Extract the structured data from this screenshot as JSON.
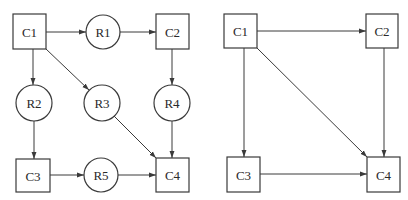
{
  "diagrams": [
    {
      "name": "left-graph",
      "nodes": [
        {
          "id": "C1",
          "label": "C1",
          "shape": "box",
          "x": 13,
          "y": 14,
          "w": 33,
          "h": 35
        },
        {
          "id": "R1",
          "label": "R1",
          "shape": "circle",
          "cx": 103,
          "cy": 32,
          "r": 17
        },
        {
          "id": "C2",
          "label": "C2",
          "shape": "box",
          "x": 156,
          "y": 14,
          "w": 33,
          "h": 35
        },
        {
          "id": "R2",
          "label": "R2",
          "shape": "circle",
          "cx": 34,
          "cy": 103,
          "r": 18
        },
        {
          "id": "R3",
          "label": "R3",
          "shape": "circle",
          "cx": 102,
          "cy": 103,
          "r": 18
        },
        {
          "id": "R4",
          "label": "R4",
          "shape": "circle",
          "cx": 172,
          "cy": 103,
          "r": 18
        },
        {
          "id": "C3",
          "label": "C3",
          "shape": "box",
          "x": 16,
          "y": 159,
          "w": 34,
          "h": 33
        },
        {
          "id": "R5",
          "label": "R5",
          "shape": "circle",
          "cx": 101,
          "cy": 175,
          "r": 17
        },
        {
          "id": "C4",
          "label": "C4",
          "shape": "box",
          "x": 156,
          "y": 158,
          "w": 33,
          "h": 34
        }
      ],
      "edges": [
        {
          "from": "C1",
          "to": "R1",
          "x1": 46,
          "y1": 32,
          "x2": 86,
          "y2": 32
        },
        {
          "from": "R1",
          "to": "C2",
          "x1": 120,
          "y1": 32,
          "x2": 156,
          "y2": 32
        },
        {
          "from": "C1",
          "to": "R2",
          "x1": 33,
          "y1": 49,
          "x2": 33,
          "y2": 85
        },
        {
          "from": "C1",
          "to": "R3",
          "x1": 46,
          "y1": 49,
          "x2": 89,
          "y2": 90
        },
        {
          "from": "C2",
          "to": "R4",
          "x1": 172,
          "y1": 49,
          "x2": 172,
          "y2": 85
        },
        {
          "from": "R2",
          "to": "C3",
          "x1": 34,
          "y1": 121,
          "x2": 34,
          "y2": 159
        },
        {
          "from": "R3",
          "to": "C4",
          "x1": 114,
          "y1": 116,
          "x2": 156,
          "y2": 158
        },
        {
          "from": "R4",
          "to": "C4",
          "x1": 172,
          "y1": 121,
          "x2": 172,
          "y2": 158
        },
        {
          "from": "C3",
          "to": "R5",
          "x1": 50,
          "y1": 175,
          "x2": 84,
          "y2": 175
        },
        {
          "from": "R5",
          "to": "C4",
          "x1": 118,
          "y1": 175,
          "x2": 156,
          "y2": 175
        }
      ]
    },
    {
      "name": "right-graph",
      "nodes": [
        {
          "id": "C1",
          "label": "C1",
          "shape": "box",
          "x": 224,
          "y": 14,
          "w": 33,
          "h": 34
        },
        {
          "id": "C2",
          "label": "C2",
          "shape": "box",
          "x": 366,
          "y": 14,
          "w": 32,
          "h": 34
        },
        {
          "id": "C3",
          "label": "C3",
          "shape": "box",
          "x": 227,
          "y": 157,
          "w": 33,
          "h": 35
        },
        {
          "id": "C4",
          "label": "C4",
          "shape": "box",
          "x": 367,
          "y": 157,
          "w": 33,
          "h": 35
        }
      ],
      "edges": [
        {
          "from": "C1",
          "to": "C2",
          "x1": 257,
          "y1": 31,
          "x2": 366,
          "y2": 31
        },
        {
          "from": "C1",
          "to": "C3",
          "x1": 244,
          "y1": 48,
          "x2": 244,
          "y2": 157
        },
        {
          "from": "C1",
          "to": "C4",
          "x1": 257,
          "y1": 48,
          "x2": 367,
          "y2": 157
        },
        {
          "from": "C2",
          "to": "C4",
          "x1": 384,
          "y1": 48,
          "x2": 384,
          "y2": 157
        },
        {
          "from": "C3",
          "to": "C4",
          "x1": 260,
          "y1": 174,
          "x2": 367,
          "y2": 174
        }
      ]
    }
  ]
}
